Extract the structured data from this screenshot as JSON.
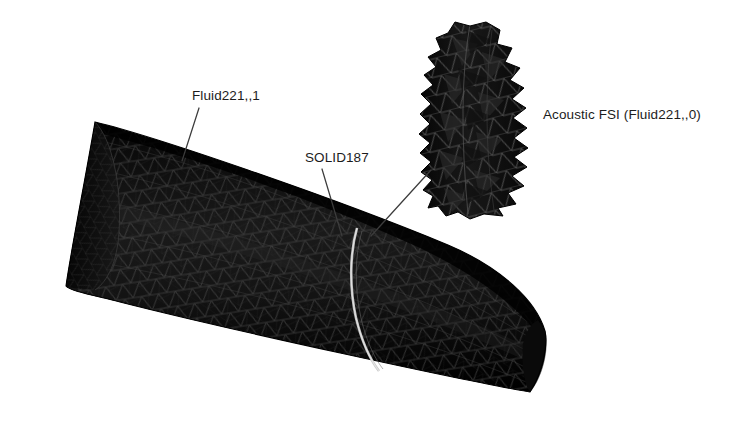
{
  "figure": {
    "background_color": "#ffffff",
    "width": 739,
    "height": 444,
    "kind": "fea-mesh-screenshot",
    "mesh_color": "#111111",
    "mesh_edge_color": "#3a3a3a",
    "seam_color": "#b9b9b9",
    "text_color": "#1c1c1c",
    "leader_color": "#3c3c3c"
  },
  "labels": {
    "fluid": "Fluid221,,1",
    "solid": "SOLID187",
    "fsi": "Acoustic FSI (Fluid221,,0)"
  },
  "annotations": [
    {
      "name": "fluid-leader",
      "x1": 199,
      "y1": 108,
      "x2": 182,
      "y2": 161
    },
    {
      "name": "solid-leader",
      "x1": 322,
      "y1": 169,
      "x2": 342,
      "y2": 236
    },
    {
      "name": "fsi-leader",
      "x1": 431,
      "y1": 170,
      "x2": 371,
      "y2": 236
    }
  ],
  "parts": {
    "duct": {
      "name": "acoustic-fluid-duct-mesh",
      "element_type": "Fluid221,,1",
      "rotation_deg": 22,
      "outline": [
        [
          95,
          122
        ],
        [
          119,
          180
        ],
        [
          66,
          286
        ],
        [
          530,
          392
        ],
        [
          545,
          330
        ],
        [
          497,
          259
        ],
        [
          420,
          210
        ]
      ]
    },
    "interface_ring": {
      "name": "solid187-structural-ring",
      "element_type": "SOLID187",
      "seam_top": [
        357,
        228
      ],
      "seam_bottom": [
        379,
        371
      ]
    },
    "fsi_inset": {
      "name": "acoustic-fsi-interface-mesh",
      "element_type": "Fluid221,,0",
      "bounds": [
        425,
        22,
        104,
        194
      ]
    }
  }
}
